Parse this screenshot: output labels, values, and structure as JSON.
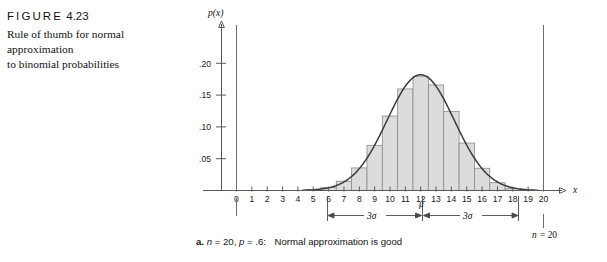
{
  "figure": {
    "label_prefix": "FIGURE",
    "label_number": "4.23",
    "description_line1": "Rule of thumb for normal approximation",
    "description_line2": "to binomial probabilities"
  },
  "caption": {
    "item_letter": "a.",
    "n_text": "n",
    "n_value": "= 20,",
    "p_text": "p",
    "p_value": "= .6:",
    "conclusion": "Normal approximation is good"
  },
  "annotations": {
    "mu_label": "μ",
    "sigma_left_label": "3σ",
    "sigma_right_label": "3σ",
    "n_marker_text": "n",
    "n_marker_value": "= 20",
    "zero_marker": "0"
  },
  "colors": {
    "bar_fill": "#dcdcdc",
    "bar_stroke": "#8a8a8d",
    "curve": "#3a3a3c",
    "axis": "#59595c",
    "text": "#111111"
  },
  "chart_data": {
    "type": "bar",
    "title": "Rule of thumb for normal approximation to binomial probabilities",
    "subtitle": "a. n = 20, p = .6:  Normal approximation is good",
    "xlabel": "x",
    "ylabel": "p(x)",
    "xlim": [
      -1,
      21
    ],
    "ylim": [
      0,
      0.215
    ],
    "grid": false,
    "legend": false,
    "x_ticks": [
      0,
      1,
      2,
      3,
      4,
      5,
      6,
      7,
      8,
      9,
      10,
      11,
      12,
      13,
      14,
      15,
      16,
      17,
      18,
      19,
      20
    ],
    "x_tick_labels": [
      "0",
      "1",
      "2",
      "3",
      "4",
      "5",
      "6",
      "7",
      "8",
      "9",
      "10",
      "11",
      "12",
      "13",
      "14",
      "15",
      "16",
      "17",
      "18",
      "19",
      "20"
    ],
    "y_ticks": [
      0.05,
      0.1,
      0.15,
      0.2
    ],
    "y_tick_labels": [
      ".05",
      ".10",
      ".15",
      ".20"
    ],
    "distribution": "binomial",
    "n": 20,
    "p": 0.6,
    "mean": 12,
    "sigma": 2.19,
    "three_sigma_lower": 6,
    "three_sigma_upper": 18,
    "bar_width": 1,
    "categories": [
      5,
      6,
      7,
      8,
      9,
      10,
      11,
      12,
      13,
      14,
      15,
      16,
      17,
      18
    ],
    "values": [
      0.0013,
      0.0049,
      0.0146,
      0.0355,
      0.071,
      0.1171,
      0.1597,
      0.1797,
      0.1659,
      0.1244,
      0.0746,
      0.035,
      0.0123,
      0.0031
    ],
    "overlay_curve": {
      "name": "normal approximation",
      "mean": 12,
      "sd": 2.19,
      "peak_value": 0.182
    },
    "reference_lines": [
      {
        "name": "lower bound at x=0",
        "x": 0
      },
      {
        "name": "upper bound at x=n",
        "x": 20
      }
    ]
  }
}
